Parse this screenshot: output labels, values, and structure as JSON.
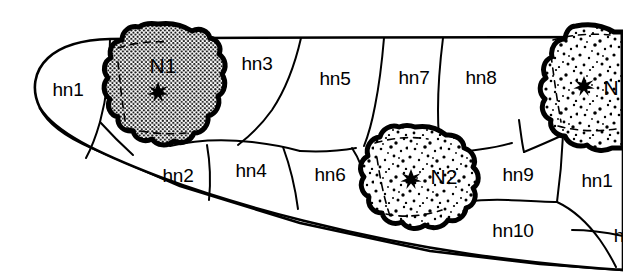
{
  "figure": {
    "background_color": "#ffffff",
    "line_color": "#000000",
    "stipple_color": "#000000",
    "style": "black-and-white line drawing"
  },
  "regions": [
    {
      "id": "hn1",
      "label": "hn1",
      "x": 68,
      "y": 91
    },
    {
      "id": "hn2",
      "label": "hn2",
      "x": 178,
      "y": 177
    },
    {
      "id": "hn3",
      "label": "hn3",
      "x": 257,
      "y": 65
    },
    {
      "id": "hn4",
      "label": "hn4",
      "x": 251,
      "y": 172
    },
    {
      "id": "hn5",
      "label": "hn5",
      "x": 335,
      "y": 80
    },
    {
      "id": "hn6",
      "label": "hn6",
      "x": 330,
      "y": 176
    },
    {
      "id": "hn7",
      "label": "hn7",
      "x": 414,
      "y": 79
    },
    {
      "id": "hn8",
      "label": "hn8",
      "x": 481,
      "y": 79
    },
    {
      "id": "hn9",
      "label": "hn9",
      "x": 518,
      "y": 176
    },
    {
      "id": "hn10",
      "label": "hn10",
      "x": 513,
      "y": 232
    },
    {
      "id": "hn11",
      "label": "hn1",
      "x": 597,
      "y": 182
    },
    {
      "id": "hn12",
      "label": "h",
      "x": 619,
      "y": 237
    }
  ],
  "nodules": [
    {
      "id": "N1",
      "label": "N1",
      "label_x": 163,
      "label_y": 67,
      "marker": "star-marker",
      "marker_x": 158,
      "marker_y": 92,
      "texture": "dense-regular-dot-grid",
      "center_x": 158,
      "center_y": 90
    },
    {
      "id": "N2",
      "label": "N2",
      "label_x": 444,
      "label_y": 178,
      "marker": "star-marker",
      "marker_x": 411,
      "marker_y": 179,
      "texture": "sparse-random-stipple",
      "center_x": 415,
      "center_y": 180
    },
    {
      "id": "N3",
      "label": "N",
      "label_x": 611,
      "label_y": 89,
      "marker": "star-marker",
      "marker_x": 584,
      "marker_y": 86,
      "texture": "sparse-random-stipple",
      "center_x": 576,
      "center_y": 88
    }
  ],
  "notes": {
    "right_edge": "cropped",
    "cropped_labels": [
      "hn1 (hn11)",
      "h",
      "N (N3)"
    ]
  }
}
